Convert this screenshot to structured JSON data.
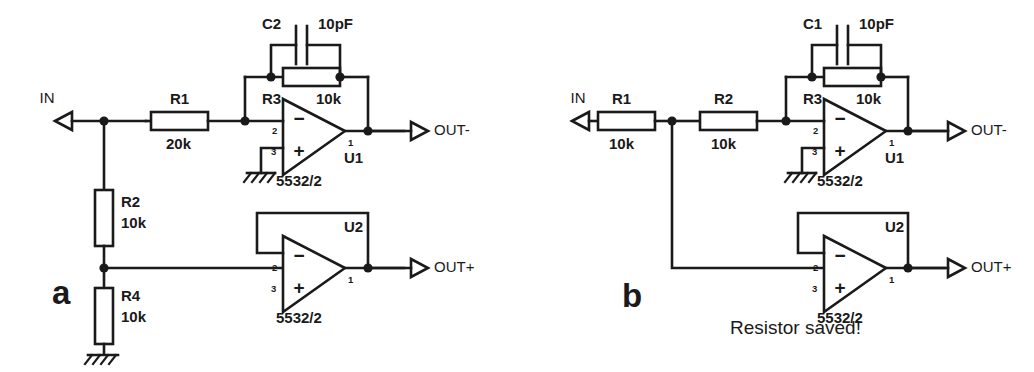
{
  "figure": {
    "background_color": "#ffffff",
    "line_color": "#1a1a1a"
  },
  "panels": [
    {
      "id": "a",
      "label": "a",
      "note": "",
      "ports": [
        {
          "name": "IN",
          "label": "IN"
        },
        {
          "name": "OUT-",
          "label": "OUT-"
        },
        {
          "name": "OUT+",
          "label": "OUT+"
        }
      ],
      "components": [
        {
          "ref": "R1",
          "type": "resistor",
          "value": "20k",
          "orientation": "horizontal"
        },
        {
          "ref": "R2",
          "type": "resistor",
          "value": "10k",
          "orientation": "vertical"
        },
        {
          "ref": "R3",
          "type": "resistor",
          "value": "10k",
          "orientation": "horizontal"
        },
        {
          "ref": "R4",
          "type": "resistor",
          "value": "10k",
          "orientation": "vertical"
        },
        {
          "ref": "C2",
          "type": "capacitor",
          "value": "10pF",
          "orientation": "horizontal"
        },
        {
          "ref": "U1",
          "type": "opamp",
          "value": "5532/2",
          "pins": [
            "2",
            "3",
            "1"
          ]
        },
        {
          "ref": "U2",
          "type": "opamp",
          "value": "5532/2",
          "pins": [
            "2",
            "3",
            "1"
          ]
        }
      ],
      "opamps": [
        {
          "ref": "U1",
          "part": "5532/2",
          "pin_inverting": "2",
          "pin_noninverting": "3",
          "pin_output": "1",
          "minus": "−",
          "plus": "+"
        },
        {
          "ref": "U2",
          "part": "5532/2",
          "pin_inverting": "2",
          "pin_noninverting": "3",
          "pin_output": "1",
          "minus": "−",
          "plus": "+"
        }
      ],
      "grounds": 2
    },
    {
      "id": "b",
      "label": "b",
      "note": "Resistor saved!",
      "ports": [
        {
          "name": "IN",
          "label": "IN"
        },
        {
          "name": "OUT-",
          "label": "OUT-"
        },
        {
          "name": "OUT+",
          "label": "OUT+"
        }
      ],
      "components": [
        {
          "ref": "R1",
          "type": "resistor",
          "value": "10k",
          "orientation": "horizontal"
        },
        {
          "ref": "R2",
          "type": "resistor",
          "value": "10k",
          "orientation": "horizontal"
        },
        {
          "ref": "R3",
          "type": "resistor",
          "value": "10k",
          "orientation": "horizontal"
        },
        {
          "ref": "C1",
          "type": "capacitor",
          "value": "10pF",
          "orientation": "horizontal"
        },
        {
          "ref": "U1",
          "type": "opamp",
          "value": "5532/2",
          "pins": [
            "2",
            "3",
            "1"
          ]
        },
        {
          "ref": "U2",
          "type": "opamp",
          "value": "5532/2",
          "pins": [
            "2",
            "3",
            "1"
          ]
        }
      ],
      "opamps": [
        {
          "ref": "U1",
          "part": "5532/2",
          "pin_inverting": "2",
          "pin_noninverting": "3",
          "pin_output": "1",
          "minus": "−",
          "plus": "+"
        },
        {
          "ref": "U2",
          "part": "5532/2",
          "pin_inverting": "2",
          "pin_noninverting": "3",
          "pin_output": "1",
          "minus": "−",
          "plus": "+"
        }
      ],
      "grounds": 1
    }
  ],
  "a": {
    "panel_label": "a",
    "in_label": "IN",
    "out_minus_label": "OUT-",
    "out_plus_label": "OUT+",
    "r1_ref": "R1",
    "r1_val": "20k",
    "r2_ref": "R2",
    "r2_val": "10k",
    "r3_ref": "R3",
    "r3_val": "10k",
    "r4_ref": "R4",
    "r4_val": "10k",
    "c2_ref": "C2",
    "c2_val": "10pF",
    "u1_ref": "U1",
    "u1_part": "5532/2",
    "u1_pin_inv": "2",
    "u1_pin_non": "3",
    "u1_pin_out": "1",
    "u2_ref": "U2",
    "u2_part": "5532/2",
    "u2_pin_inv": "2",
    "u2_pin_non": "3",
    "u2_pin_out": "1",
    "minus": "−",
    "plus": "+"
  },
  "b": {
    "panel_label": "b",
    "in_label": "IN",
    "out_minus_label": "OUT-",
    "out_plus_label": "OUT+",
    "note": "Resistor saved!",
    "r1_ref": "R1",
    "r1_val": "10k",
    "r2_ref": "R2",
    "r2_val": "10k",
    "r3_ref": "R3",
    "r3_val": "10k",
    "c1_ref": "C1",
    "c1_val": "10pF",
    "u1_ref": "U1",
    "u1_part": "5532/2",
    "u1_pin_inv": "2",
    "u1_pin_non": "3",
    "u1_pin_out": "1",
    "u2_ref": "U2",
    "u2_part": "5532/2",
    "u2_pin_inv": "2",
    "u2_pin_non": "3",
    "u2_pin_out": "1",
    "minus": "−",
    "plus": "+"
  }
}
